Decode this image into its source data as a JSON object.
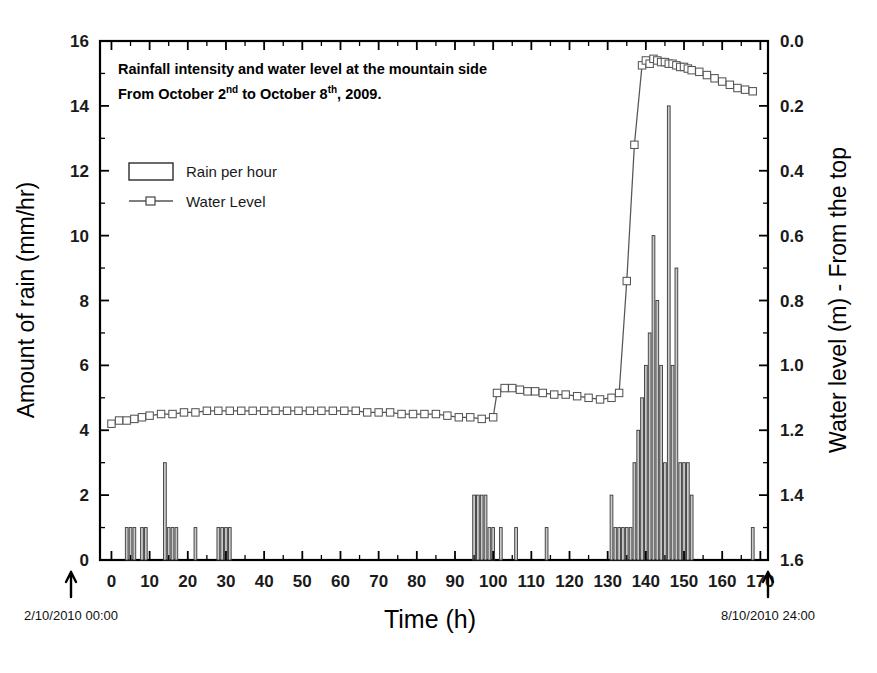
{
  "figure": {
    "title_line1": "Rainfall intensity and water level at the mountain side",
    "title_line2_a": "From October 2",
    "title_line2_sup1": "nd",
    "title_line2_b": " to October 8",
    "title_line2_sup2": "th",
    "title_line2_c": ", 2009.",
    "legend": [
      {
        "label": "Rain per hour",
        "marker": "rectangle-outline"
      },
      {
        "label": "Water Level",
        "marker": "line-with-open-square"
      }
    ],
    "annotations": [
      {
        "name": "start-time",
        "text": "2/10/2010 00:00",
        "x_hours": 0,
        "arrow": "up-arrow-icon"
      },
      {
        "name": "end-time",
        "text": "8/10/2010 24:00",
        "x_hours": 168,
        "arrow": "up-arrow-icon"
      }
    ],
    "colors": {
      "axis": "#000000",
      "bar_outline": "#3a3a3a",
      "bar_fill": "#c9c9c9",
      "line": "#555555",
      "marker_face": "#ffffff"
    }
  },
  "chart_data": {
    "type": "bar",
    "xlabel": "Time (h)",
    "ylabel": "Amount of rain (mm/hr)",
    "y2label": "Water level (m) - From the top",
    "xlim": [
      -3,
      172
    ],
    "ylim": [
      0,
      16
    ],
    "y2lim": [
      1.6,
      0.0
    ],
    "y2_inverted": true,
    "grid": false,
    "legend_position": "upper-left",
    "xticks": [
      0,
      10,
      20,
      30,
      40,
      50,
      60,
      70,
      80,
      90,
      100,
      110,
      120,
      130,
      140,
      150,
      160,
      170
    ],
    "yticks": [
      0,
      2,
      4,
      6,
      8,
      10,
      12,
      14,
      16
    ],
    "y2ticks": [
      0.0,
      0.2,
      0.4,
      0.6,
      0.8,
      1.0,
      1.2,
      1.4,
      1.6
    ],
    "xtick_minor_step": 5,
    "ytick_minor_step": 1,
    "y2tick_minor_step": 0.1,
    "series": [
      {
        "name": "Rain per hour",
        "axis": "left",
        "units": "mm/hr",
        "type": "bar",
        "x": [
          4,
          5,
          6,
          8,
          9,
          14,
          15,
          16,
          17,
          22,
          28,
          29,
          30,
          31,
          95,
          96,
          97,
          98,
          99,
          100,
          102,
          106,
          114,
          131,
          132,
          133,
          134,
          135,
          136,
          137,
          138,
          139,
          140,
          141,
          142,
          143,
          144,
          145,
          146,
          147,
          148,
          149,
          150,
          151,
          152,
          168
        ],
        "values": [
          1,
          1,
          1,
          1,
          1,
          3,
          1,
          1,
          1,
          1,
          1,
          1,
          1,
          1,
          2,
          2,
          2,
          2,
          1,
          1,
          1,
          1,
          1,
          2,
          1,
          1,
          1,
          1,
          1,
          3,
          4,
          5,
          6,
          7,
          10,
          8,
          6,
          3,
          14,
          6,
          9,
          3,
          3,
          3,
          2,
          1
        ]
      },
      {
        "name": "Water Level",
        "axis": "right",
        "units": "m",
        "type": "line",
        "marker": "open-square",
        "x": [
          0,
          2,
          4,
          6,
          8,
          10,
          13,
          16,
          19,
          22,
          25,
          28,
          31,
          34,
          37,
          40,
          43,
          46,
          49,
          52,
          55,
          58,
          61,
          64,
          67,
          70,
          73,
          76,
          79,
          82,
          85,
          88,
          91,
          94,
          97,
          100,
          101,
          103,
          105,
          107,
          109,
          111,
          113,
          116,
          119,
          122,
          125,
          128,
          131,
          133,
          135,
          137,
          139,
          140,
          141,
          142,
          143,
          144,
          145,
          146,
          147,
          148,
          149,
          150,
          151,
          152,
          154,
          156,
          158,
          160,
          162,
          164,
          166,
          168
        ],
        "values": [
          1.18,
          1.17,
          1.17,
          1.165,
          1.16,
          1.155,
          1.15,
          1.15,
          1.145,
          1.145,
          1.14,
          1.14,
          1.14,
          1.14,
          1.14,
          1.14,
          1.14,
          1.14,
          1.14,
          1.14,
          1.14,
          1.14,
          1.14,
          1.14,
          1.145,
          1.145,
          1.145,
          1.15,
          1.15,
          1.15,
          1.15,
          1.155,
          1.16,
          1.16,
          1.165,
          1.16,
          1.085,
          1.07,
          1.07,
          1.075,
          1.08,
          1.08,
          1.085,
          1.09,
          1.09,
          1.095,
          1.1,
          1.105,
          1.1,
          1.085,
          0.74,
          0.32,
          0.075,
          0.06,
          0.07,
          0.055,
          0.06,
          0.065,
          0.065,
          0.07,
          0.07,
          0.075,
          0.08,
          0.08,
          0.085,
          0.09,
          0.095,
          0.105,
          0.115,
          0.125,
          0.135,
          0.145,
          0.15,
          0.155
        ]
      }
    ]
  }
}
